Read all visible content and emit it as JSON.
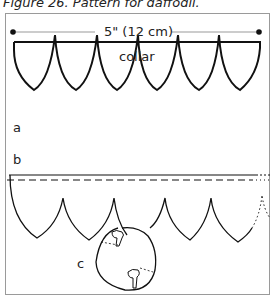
{
  "figure": {
    "caption": "Figure 26. Pattern for daffodil.",
    "dimension_label": "5\" (12 cm)",
    "collar_label": "collar",
    "part_labels": {
      "a": "a",
      "b": "b",
      "c": "c"
    }
  }
}
